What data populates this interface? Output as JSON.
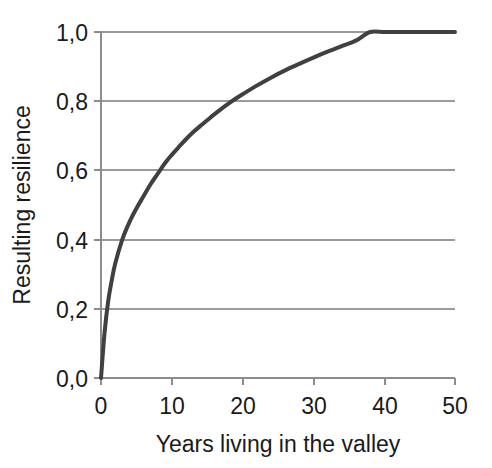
{
  "chart_data": {
    "type": "line",
    "title": "",
    "subtitle": "",
    "xlabel": "Years living in the valley",
    "ylabel": "Resulting resilience",
    "xlim": [
      0,
      50
    ],
    "ylim": [
      0,
      1.0
    ],
    "grid": "horizontal",
    "legend": "none",
    "decimal_separator": ",",
    "xticks": [
      0,
      10,
      20,
      30,
      40,
      50
    ],
    "xtick_labels": [
      "0",
      "10",
      "20",
      "30",
      "40",
      "50"
    ],
    "yticks": [
      0.0,
      0.2,
      0.4,
      0.6,
      0.8,
      1.0
    ],
    "ytick_labels": [
      "0,0",
      "0,2",
      "0,4",
      "0,6",
      "0,8",
      "1,0"
    ],
    "series": [
      {
        "name": "Resulting resilience",
        "color": "#404040",
        "line_width": 4,
        "x": [
          0,
          0.5,
          1,
          1.5,
          2,
          3,
          4,
          5,
          6,
          7,
          8,
          9,
          10,
          11,
          12,
          13,
          14,
          15,
          16,
          17,
          18,
          19,
          20,
          22,
          24,
          26,
          28,
          30,
          32,
          34,
          36,
          38,
          40,
          42,
          44,
          46,
          48,
          50
        ],
        "y": [
          0.0,
          0.13,
          0.22,
          0.28,
          0.33,
          0.4,
          0.45,
          0.49,
          0.525,
          0.56,
          0.59,
          0.62,
          0.645,
          0.668,
          0.69,
          0.71,
          0.728,
          0.745,
          0.762,
          0.778,
          0.793,
          0.807,
          0.82,
          0.845,
          0.868,
          0.889,
          0.908,
          0.926,
          0.943,
          0.959,
          0.975,
          1.0,
          1.0,
          1.0,
          1.0,
          1.0,
          1.0,
          1.0
        ]
      }
    ],
    "annotations": []
  },
  "axes": {
    "y_axis_title": "Resulting resilience",
    "x_axis_title": "Years living in the valley",
    "axis_color": "#8c8c8c",
    "grid_color": "#9a9a9a",
    "text_color": "#1a1a1a"
  }
}
